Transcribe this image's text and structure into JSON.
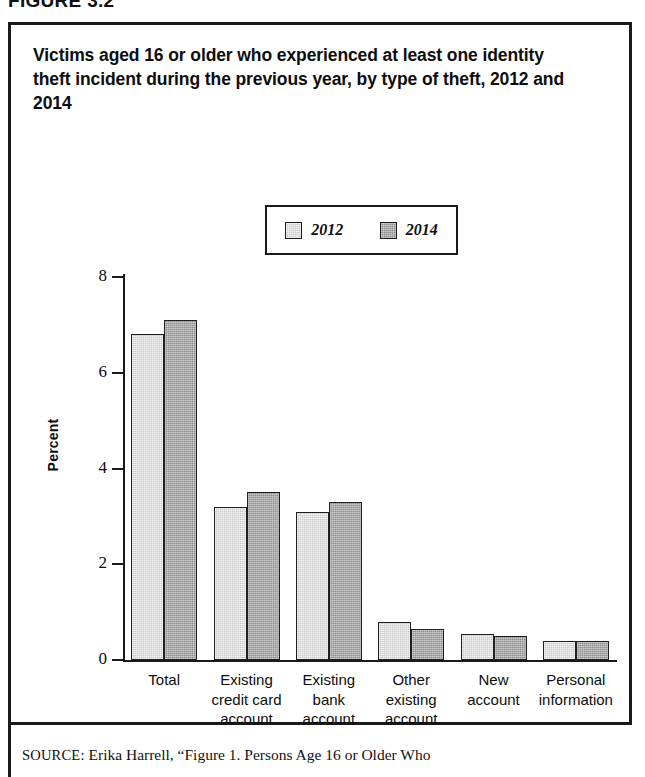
{
  "figure": {
    "number": "FIGURE 3.2",
    "title": "Victims aged 16 or older who experienced at least one identity theft incident during the previous year, by type of theft, 2012 and 2014"
  },
  "source": {
    "label": "SOURCE:",
    "text": "Erika Harrell, “Figure 1. Persons Age 16 or Older Who"
  },
  "chart_data": {
    "type": "bar",
    "title": "Victims aged 16 or older who experienced at least one identity theft incident during the previous year, by type of theft, 2012 and 2014",
    "xlabel": "",
    "ylabel": "Percent",
    "ylim": [
      0,
      8
    ],
    "yticks": [
      0,
      2,
      4,
      6,
      8
    ],
    "ytick_labels": [
      "0",
      "2",
      "4",
      "6",
      "8"
    ],
    "grid": false,
    "legend_position": "top-center",
    "categories": [
      "Total",
      "Existing credit card account",
      "Existing bank account",
      "Other existing account",
      "New account",
      "Personal information"
    ],
    "category_lines": [
      [
        "Total"
      ],
      [
        "Existing",
        "credit card",
        "account"
      ],
      [
        "Existing",
        "bank",
        "account"
      ],
      [
        "Other",
        "existing",
        "account"
      ],
      [
        "New",
        "account"
      ],
      [
        "Personal",
        "information"
      ]
    ],
    "series": [
      {
        "name": "2012",
        "color": "#c9c9c9",
        "values": [
          6.8,
          3.2,
          3.1,
          0.8,
          0.55,
          0.4
        ]
      },
      {
        "name": "2014",
        "color": "#8e8e8e",
        "values": [
          7.1,
          3.5,
          3.3,
          0.65,
          0.5,
          0.4
        ]
      }
    ]
  }
}
